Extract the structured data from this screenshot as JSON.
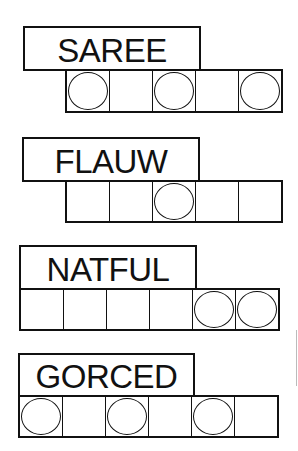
{
  "puzzles": [
    {
      "scrambled": "SAREE",
      "letter_count": 5,
      "circled_positions": [
        1,
        3,
        5
      ],
      "label_box": {
        "x": 23,
        "y": 26,
        "w": 178,
        "h": 45
      },
      "cells_box": {
        "x": 65,
        "y": 69,
        "w": 218,
        "h": 44
      }
    },
    {
      "scrambled": "FLAUW",
      "letter_count": 5,
      "circled_positions": [
        3
      ],
      "label_box": {
        "x": 22,
        "y": 137,
        "w": 178,
        "h": 45
      },
      "cells_box": {
        "x": 65,
        "y": 180,
        "w": 218,
        "h": 43
      }
    },
    {
      "scrambled": "NATFUL",
      "letter_count": 6,
      "circled_positions": [
        5,
        6
      ],
      "label_box": {
        "x": 19,
        "y": 245,
        "w": 178,
        "h": 45
      },
      "cells_box": {
        "x": 19,
        "y": 288,
        "w": 261,
        "h": 43
      }
    },
    {
      "scrambled": "GORCED",
      "letter_count": 6,
      "circled_positions": [
        1,
        3,
        5
      ],
      "label_box": {
        "x": 18,
        "y": 353,
        "w": 177,
        "h": 44
      },
      "cells_box": {
        "x": 18,
        "y": 395,
        "w": 261,
        "h": 43
      }
    }
  ],
  "colors": {
    "ink": "#111111",
    "paper": "#ffffff"
  }
}
